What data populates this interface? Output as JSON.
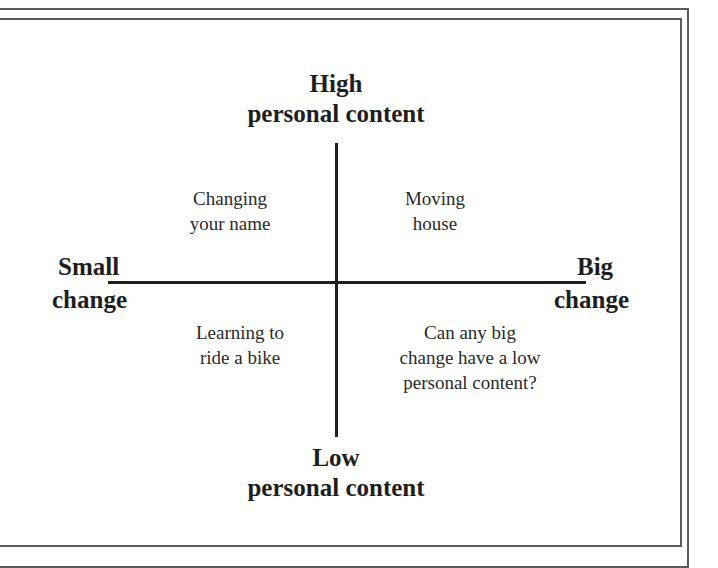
{
  "diagram": {
    "type": "quadrant",
    "axes": {
      "vertical": {
        "top_label": [
          "High",
          "personal content"
        ],
        "bottom_label": [
          "Low",
          "personal content"
        ]
      },
      "horizontal": {
        "left_label": [
          "Small",
          "change"
        ],
        "right_label": [
          "Big",
          "change"
        ]
      }
    },
    "quadrants": {
      "top_left": [
        "Changing",
        "your name"
      ],
      "top_right": [
        "Moving",
        "house"
      ],
      "bottom_left": [
        "Learning to",
        "ride a bike"
      ],
      "bottom_right": [
        "Can any big",
        "change have a low",
        "personal content?"
      ]
    },
    "colors": {
      "text": "#1e1e1e",
      "frame": "#5a5a5a",
      "background": "#ffffff"
    }
  }
}
